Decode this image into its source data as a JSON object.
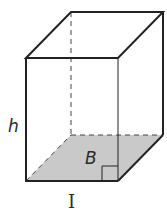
{
  "figure": {
    "type": "rectangular-prism",
    "labels": {
      "height": "h",
      "base": "B",
      "length": "I"
    },
    "colors": {
      "edge": "#222222",
      "base_fill": "#c9c9c9",
      "hidden_edge": "#444444"
    }
  }
}
